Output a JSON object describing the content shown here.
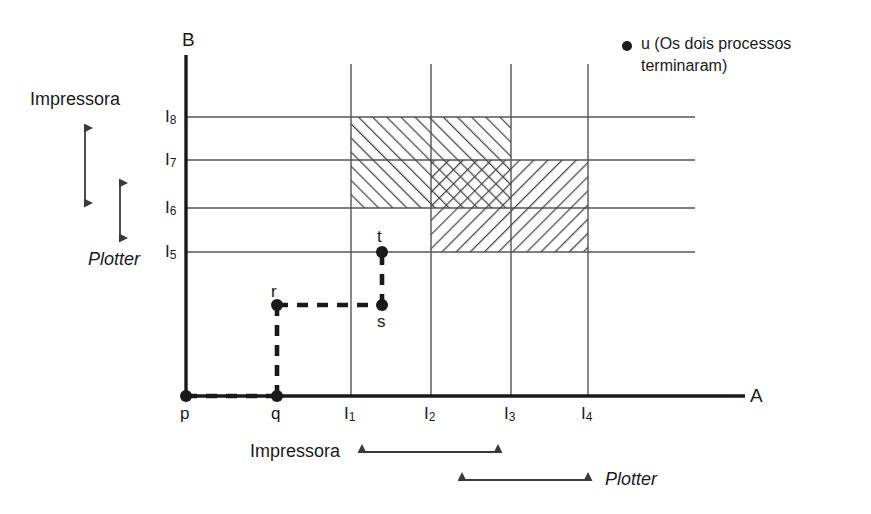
{
  "figure": {
    "axis_b_label": "B",
    "axis_a_label": "A",
    "legend": {
      "marker": "filled-dot",
      "line1": "u (Os dois processos",
      "line2": "terminaram)"
    },
    "left_annotations": {
      "impressora": "Impressora",
      "plotter": "Plotter"
    },
    "bottom_annotations": {
      "impressora": "Impressora",
      "plotter": "Plotter"
    },
    "y_ticks": [
      {
        "base": "I",
        "sub": "5"
      },
      {
        "base": "I",
        "sub": "6"
      },
      {
        "base": "I",
        "sub": "7"
      },
      {
        "base": "I",
        "sub": "8"
      }
    ],
    "x_ticks": [
      {
        "base": "p",
        "sub": ""
      },
      {
        "base": "q",
        "sub": ""
      },
      {
        "base": "I",
        "sub": "1"
      },
      {
        "base": "I",
        "sub": "2"
      },
      {
        "base": "I",
        "sub": "3"
      },
      {
        "base": "I",
        "sub": "4"
      }
    ],
    "path_points": [
      {
        "name": "p",
        "label": "p"
      },
      {
        "name": "q",
        "label": "q"
      },
      {
        "name": "r",
        "label": "r"
      },
      {
        "name": "s",
        "label": "s"
      },
      {
        "name": "t",
        "label": "t"
      }
    ],
    "colors": {
      "ink": "#1a1a1a",
      "grid": "#555555",
      "hatch": "#4a4a4a",
      "background": "#ffffff"
    }
  }
}
